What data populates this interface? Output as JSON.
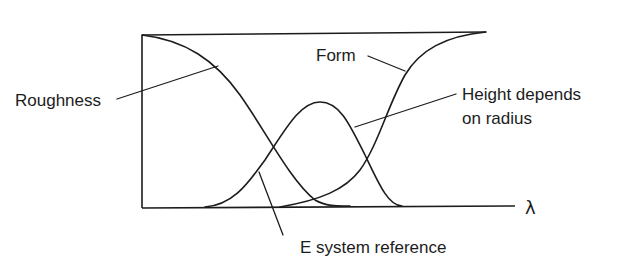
{
  "diagram": {
    "type": "filter-transmission-curves",
    "axis": {
      "x_symbol": "λ"
    },
    "labels": {
      "roughness": "Roughness",
      "form": "Form",
      "height_line1": "Height depends",
      "height_line2": "on radius",
      "e_system": "E system reference"
    },
    "curves": [
      {
        "name": "Roughness",
        "shape": "decreasing S-curve, high at short wavelengths"
      },
      {
        "name": "E system reference",
        "shape": "bell curve, peak in middle band"
      },
      {
        "name": "Form",
        "shape": "increasing S-curve, high at long wavelengths"
      }
    ],
    "colors": {
      "stroke": "#1c1c1c",
      "background": "#ffffff"
    }
  }
}
